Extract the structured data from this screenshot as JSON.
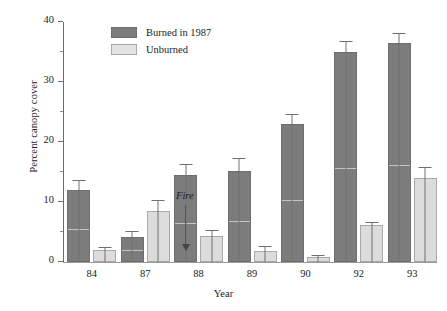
{
  "chart_data": {
    "type": "bar",
    "title": "",
    "xlabel": "Year",
    "ylabel": "Percent canopy cover",
    "categories": [
      "84",
      "87",
      "88",
      "89",
      "90",
      "92",
      "93"
    ],
    "ylim": [
      0,
      40
    ],
    "yticks": [
      0,
      10,
      20,
      30,
      40
    ],
    "ytick_labels": [
      "0",
      "10",
      "20",
      "30",
      "40"
    ],
    "yminor_ticks": [
      5,
      15,
      25,
      35
    ],
    "grid": false,
    "legend_position": "top-left-inside",
    "series": [
      {
        "name": "Burned in 1987",
        "color": "#7c7c7c",
        "values": [
          12.0,
          4.2,
          14.5,
          15.2,
          23.0,
          35.0,
          36.5
        ],
        "errors": [
          1.6,
          1.0,
          1.9,
          2.2,
          1.6,
          1.9,
          1.7
        ]
      },
      {
        "name": "Unburned",
        "color": "#dcdcdc",
        "values": [
          2.0,
          8.5,
          4.3,
          1.9,
          0.8,
          6.2,
          14.0
        ],
        "errors": [
          0.5,
          1.8,
          1.1,
          0.8,
          0.3,
          0.5,
          1.9
        ]
      }
    ],
    "annotations": [
      {
        "text": "Fire",
        "category": "87",
        "style": "italic",
        "arrow": "down"
      }
    ]
  },
  "legend": {
    "items": [
      {
        "label": "Burned in 1987",
        "swatch": "burned"
      },
      {
        "label": "Unburned",
        "swatch": "unburned"
      }
    ]
  },
  "axes": {
    "y_title": "Percent canopy cover",
    "x_title": "Year"
  },
  "annotation": {
    "fire_label": "Fire"
  }
}
